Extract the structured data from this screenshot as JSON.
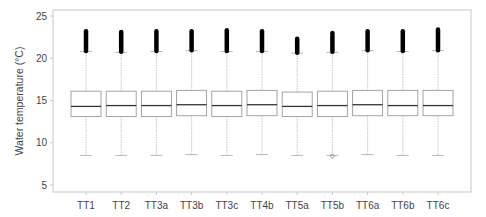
{
  "chart_data": {
    "type": "boxplot",
    "title": "",
    "xlabel": "",
    "ylabel": "Water temperature (°C)",
    "ylim": [
      4.2,
      25.8
    ],
    "yticks": [
      5,
      10,
      15,
      20,
      25
    ],
    "grid": false,
    "legend": null,
    "categories": [
      "TT1",
      "TT2",
      "TT3a",
      "TT3b",
      "TT3c",
      "TT4b",
      "TT5a",
      "TT5b",
      "TT6a",
      "TT6b",
      "TT6c"
    ],
    "series": [
      {
        "name": "TT1",
        "whisker_low": 8.5,
        "q1": 13.1,
        "median": 14.3,
        "q3": 16.1,
        "whisker_high": 20.8,
        "outlier_max": 23.2
      },
      {
        "name": "TT2",
        "whisker_low": 8.5,
        "q1": 13.1,
        "median": 14.4,
        "q3": 16.1,
        "whisker_high": 20.7,
        "outlier_max": 23.1
      },
      {
        "name": "TT3a",
        "whisker_low": 8.5,
        "q1": 13.1,
        "median": 14.4,
        "q3": 16.1,
        "whisker_high": 20.8,
        "outlier_max": 23.2
      },
      {
        "name": "TT3b",
        "whisker_low": 8.6,
        "q1": 13.2,
        "median": 14.5,
        "q3": 16.2,
        "whisker_high": 20.9,
        "outlier_max": 23.2
      },
      {
        "name": "TT3c",
        "whisker_low": 8.5,
        "q1": 13.1,
        "median": 14.4,
        "q3": 16.1,
        "whisker_high": 20.8,
        "outlier_max": 23.3
      },
      {
        "name": "TT4b",
        "whisker_low": 8.6,
        "q1": 13.2,
        "median": 14.5,
        "q3": 16.2,
        "whisker_high": 20.8,
        "outlier_max": 23.2
      },
      {
        "name": "TT5a",
        "whisker_low": 8.5,
        "q1": 13.1,
        "median": 14.3,
        "q3": 16.0,
        "whisker_high": 20.6,
        "outlier_max": 22.3
      },
      {
        "name": "TT5b",
        "whisker_low": 8.5,
        "q1": 13.1,
        "median": 14.4,
        "q3": 16.1,
        "whisker_high": 20.7,
        "outlier_max": 23.0,
        "low_outlier": 8.4
      },
      {
        "name": "TT6a",
        "whisker_low": 8.6,
        "q1": 13.2,
        "median": 14.5,
        "q3": 16.2,
        "whisker_high": 20.9,
        "outlier_max": 23.2
      },
      {
        "name": "TT6b",
        "whisker_low": 8.5,
        "q1": 13.2,
        "median": 14.4,
        "q3": 16.2,
        "whisker_high": 20.8,
        "outlier_max": 23.2
      },
      {
        "name": "TT6c",
        "whisker_low": 8.5,
        "q1": 13.2,
        "median": 14.4,
        "q3": 16.2,
        "whisker_high": 20.9,
        "outlier_max": 23.4
      }
    ]
  },
  "style": {
    "box_color": "#9a9a9a",
    "median_color": "#333333",
    "whisker_color": "#b8b8b8",
    "outlier_color": "#000000",
    "frame_color": "#c8c8c8",
    "text_color": "#444444"
  }
}
